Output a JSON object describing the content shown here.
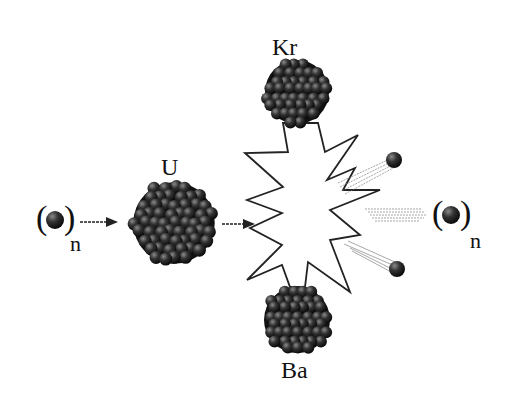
{
  "diagram": {
    "nodes": {
      "incoming_neutron": {
        "label": "n",
        "symbol": "neutron"
      },
      "uranium": {
        "label": "U"
      },
      "krypton": {
        "label": "Kr"
      },
      "barium": {
        "label": "Ba"
      },
      "outgoing_neutrons": {
        "label": "n",
        "count_drawn": 3
      }
    },
    "edges": [
      {
        "from": "incoming_neutron",
        "to": "uranium",
        "type": "arrow"
      },
      {
        "from": "uranium",
        "to": "fission_burst",
        "type": "arrow"
      },
      {
        "from": "fission_burst",
        "to": "krypton",
        "type": "connector"
      },
      {
        "from": "fission_burst",
        "to": "barium",
        "type": "connector"
      },
      {
        "from": "fission_burst",
        "to": "outgoing_neutrons",
        "type": "motion-trails"
      }
    ],
    "colors": {
      "nucleon": "#2a2a2a",
      "nucleon_highlight": "#6a6a6a",
      "outline": "#222222",
      "background": "#ffffff"
    }
  }
}
